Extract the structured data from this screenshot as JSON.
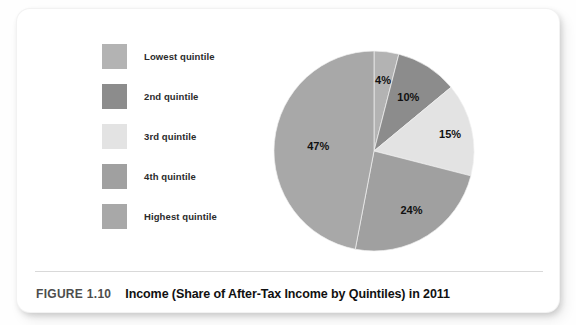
{
  "figure": {
    "tag": "FIGURE 1.10",
    "title": "Income (Share of After-Tax Income by Quintiles) in 2011"
  },
  "legend": {
    "items": [
      {
        "label": "Lowest quintile",
        "color": "#b3b3b3"
      },
      {
        "label": "2nd quintile",
        "color": "#8c8c8c"
      },
      {
        "label": "3rd quintile",
        "color": "#e3e3e3"
      },
      {
        "label": "4th quintile",
        "color": "#a0a0a0"
      },
      {
        "label": "Highest quintile",
        "color": "#a8a8a8"
      }
    ]
  },
  "chart_data": {
    "type": "pie",
    "title": "Income (Share of After-Tax Income by Quintiles) in 2011",
    "xlabel": "",
    "ylabel": "",
    "legend_position": "left",
    "grid": false,
    "start_angle_deg": 0,
    "direction": "clockwise",
    "units": "percent",
    "categories": [
      "Lowest quintile",
      "2nd quintile",
      "3rd quintile",
      "4th quintile",
      "Highest quintile"
    ],
    "values": [
      4,
      10,
      15,
      24,
      47
    ],
    "colors": [
      "#b3b3b3",
      "#8c8c8c",
      "#e3e3e3",
      "#a0a0a0",
      "#a8a8a8"
    ],
    "data_labels": [
      "4%",
      "10%",
      "15%",
      "24%",
      "47%"
    ],
    "slices": [
      {
        "label": "Lowest quintile",
        "value": 4,
        "data_label": "4%",
        "color": "#b3b3b3"
      },
      {
        "label": "2nd quintile",
        "value": 10,
        "data_label": "10%",
        "color": "#8c8c8c"
      },
      {
        "label": "3rd quintile",
        "value": 15,
        "data_label": "15%",
        "color": "#e3e3e3"
      },
      {
        "label": "4th quintile",
        "value": 24,
        "data_label": "24%",
        "color": "#a0a0a0"
      },
      {
        "label": "Highest quintile",
        "value": 47,
        "data_label": "47%",
        "color": "#a8a8a8"
      }
    ],
    "total": 100
  }
}
